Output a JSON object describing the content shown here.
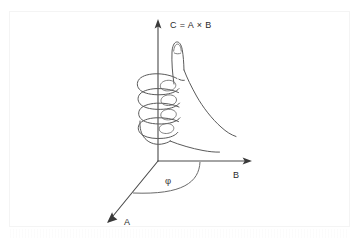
{
  "figure": {
    "background_color": "#ffffff",
    "frame_color": "#f4f4f4",
    "stroke_color": "#4a4a4a",
    "labels": {
      "c_axis": "C = A × B",
      "b_axis": "B",
      "a_axis": "A",
      "angle": "φ"
    },
    "axes": [
      {
        "name": "c-axis",
        "label": "C = A × B",
        "origin": [
          158,
          161
        ],
        "tip": [
          158,
          22
        ],
        "direction": "up"
      },
      {
        "name": "b-axis",
        "label": "B",
        "origin": [
          158,
          161
        ],
        "tip": [
          250,
          161
        ],
        "direction": "right"
      },
      {
        "name": "a-axis",
        "label": "A",
        "origin": [
          158,
          161
        ],
        "tip": [
          108,
          222
        ],
        "direction": "down-left"
      }
    ],
    "angle_marker": {
      "symbol": "φ",
      "between": [
        "A",
        "B"
      ],
      "position": [
        168,
        180
      ]
    },
    "hand": {
      "description": "right hand, fist curled with thumb pointing up along C",
      "fingers": 4,
      "thumb_direction": "up"
    }
  }
}
